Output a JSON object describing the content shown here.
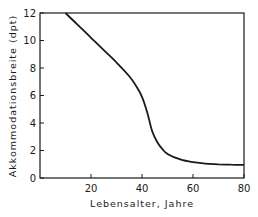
{
  "chart_data": {
    "type": "line",
    "title": "",
    "xlabel": "Lebensalter,  Jahre",
    "ylabel": "Akkommodationsbreite  (dpt)",
    "xlim": [
      0,
      80
    ],
    "ylim": [
      0,
      12
    ],
    "xticks": [
      20,
      40,
      60,
      80
    ],
    "yticks": [
      0,
      2,
      4,
      6,
      8,
      10,
      12
    ],
    "grid": false,
    "legend": null,
    "series": [
      {
        "name": "Akkommodationsbreite",
        "color": "#1a1a1a",
        "x": [
          10,
          15,
          20,
          25,
          30,
          35,
          38,
          40,
          42,
          44,
          46,
          48,
          50,
          55,
          60,
          65,
          70,
          75,
          80
        ],
        "y": [
          12.0,
          11.1,
          10.2,
          9.3,
          8.4,
          7.4,
          6.6,
          5.9,
          4.8,
          3.4,
          2.6,
          2.1,
          1.75,
          1.35,
          1.15,
          1.05,
          1.0,
          0.97,
          0.95
        ]
      }
    ]
  }
}
